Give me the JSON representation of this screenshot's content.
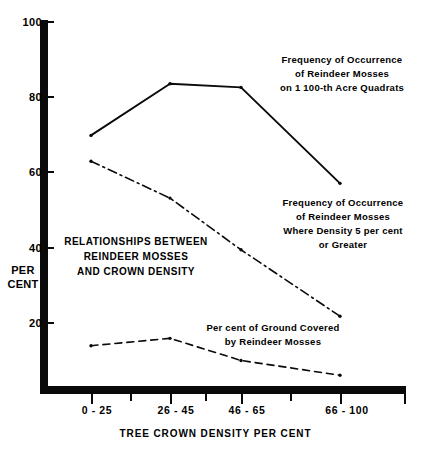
{
  "chart_data": {
    "type": "line",
    "title": "RELATIONSHIPS BETWEEN REINDEER MOSSES AND CROWN DENSITY",
    "title_lines": [
      "RELATIONSHIPS BETWEEN",
      "REINDEER MOSSES",
      "AND CROWN DENSITY"
    ],
    "xlabel": "TREE CROWN DENSITY PER CENT",
    "ylabel": "PER CENT",
    "ylabel_lines": [
      "PER",
      "CENT"
    ],
    "categories": [
      "0 - 25",
      "26 - 45",
      "46 - 65",
      "66 - 100"
    ],
    "ylim": [
      0,
      100
    ],
    "yticks": [
      100,
      80,
      60,
      40,
      20
    ],
    "grid": false,
    "legend": "annotations",
    "series": [
      {
        "name": "Frequency of Occurrence of Reindeer Mosses on 1 100-th Acre Quadrats",
        "style": "solid",
        "values": [
          69,
          83,
          82,
          56
        ],
        "annotation_lines": [
          "Frequency of Occurrence",
          "of Reindeer Mosses",
          "on 1 100-th Acre Quadrats"
        ]
      },
      {
        "name": "Frequency of Occurrence of Reindeer Mosses Where Density 5 per cent or Greater",
        "style": "dash-dot",
        "values": [
          62,
          52,
          38,
          20
        ],
        "annotation_lines": [
          "Frequency of Occurrence",
          "of Reindeer Mosses",
          "Where Density 5 per cent",
          "or Greater"
        ]
      },
      {
        "name": "Per cent of Ground Covered by Reindeer Mosses",
        "style": "dashed",
        "values": [
          12,
          14,
          8,
          4
        ],
        "annotation_lines": [
          "Per cent of Ground Covered",
          "by Reindeer Mosses"
        ]
      }
    ]
  },
  "axis": {
    "y_tick_labels": [
      "100",
      "80",
      "60",
      "40",
      "20"
    ],
    "x_tick_labels": [
      "0 - 25",
      "26 - 45",
      "46 - 65",
      "66 - 100"
    ],
    "y_axis_title_line1": "PER",
    "y_axis_title_line2": "CENT",
    "x_axis_title": "TREE CROWN DENSITY PER CENT"
  },
  "annotations": {
    "solid_l1": "Frequency of Occurrence",
    "solid_l2": "of Reindeer Mosses",
    "solid_l3": "on 1 100-th Acre Quadrats",
    "dashdot_l1": "Frequency of Occurrence",
    "dashdot_l2": "of Reindeer Mosses",
    "dashdot_l3": "Where Density 5 per cent",
    "dashdot_l4": "or Greater",
    "dotted_l1": "Per cent of Ground Covered",
    "dotted_l2": "by Reindeer Mosses",
    "caption_l1": "RELATIONSHIPS BETWEEN",
    "caption_l2": "REINDEER MOSSES",
    "caption_l3": "AND CROWN DENSITY"
  },
  "colors": {
    "ink": "#0a0a0a",
    "background": "#ffffff"
  }
}
